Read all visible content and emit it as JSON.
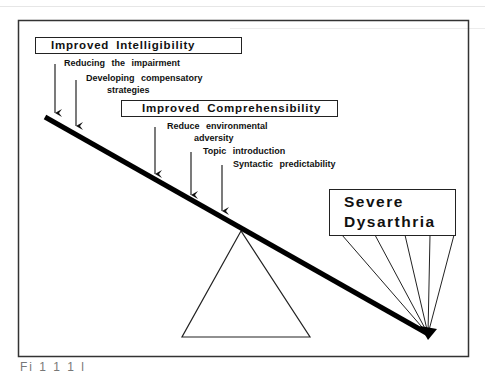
{
  "diagram": {
    "boxes": {
      "intelligibility": "Improved    Intelligibility",
      "comprehensibility": "Improved    Comprehensibility",
      "severe_line1": "Severe",
      "severe_line2": "Dysarthria"
    },
    "intelligibility_items": [
      "Reducing   the   impairment",
      "Developing   compensatory",
      "strategies"
    ],
    "comprehensibility_items": [
      "Reduce   environmental",
      "adversity",
      "Topic   introduction",
      "Syntactic   predictability"
    ],
    "caption_fragment": "Fi        1 1   1        l                         "
  }
}
